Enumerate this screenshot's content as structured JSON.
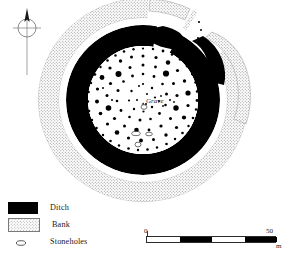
{
  "figure": {
    "kind": "archaeological-site-plan",
    "orientation": {
      "north_label": "",
      "icon": "north-arrow-compass-icon"
    }
  },
  "annotations": {
    "grave_label": "Grave"
  },
  "legend": {
    "items": [
      {
        "key": "ditch",
        "label": "Ditch",
        "swatch": "solid-black-rect",
        "color": "#000000"
      },
      {
        "key": "bank",
        "label": "Bank",
        "swatch": "stippled-rect",
        "color": "#d8d8d8"
      },
      {
        "key": "stoneholes",
        "label": "Stoneholes",
        "swatch": "open-ellipse",
        "color": "#ffffff"
      }
    ]
  },
  "scale": {
    "min_label": "0",
    "max_label": "50",
    "unit_label": "m",
    "segments": 4,
    "max_value": 50
  },
  "colors": {
    "ditch": "#000000",
    "bank_fill": "#dcdcdc",
    "bank_stipple": "#8a8a8a",
    "interior": "#ffffff",
    "stonehole_fill": "#000000",
    "stonehole_open_stroke": "#333333",
    "text": "#1a1a1a",
    "compass": "#6b6b6b"
  }
}
